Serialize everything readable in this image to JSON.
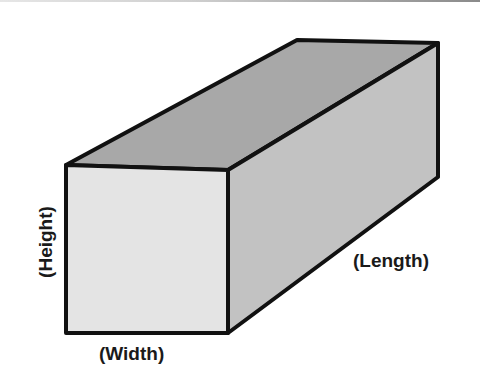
{
  "diagram": {
    "type": "rectangular-prism",
    "labels": {
      "width": "(Width)",
      "height": "(Height)",
      "length": "(Length)"
    },
    "colors": {
      "front_face": "#e4e4e4",
      "top_face": "#a8a8a8",
      "side_face": "#c2c2c2",
      "edge": "#111111",
      "text": "#1a1a1a"
    }
  }
}
